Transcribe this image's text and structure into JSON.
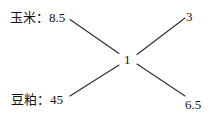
{
  "diagram": {
    "type": "node-edge-tree",
    "background_color": "#ffffff",
    "line_color": "#2b2b2b",
    "text_color": "#141414",
    "center": {
      "label": "1"
    },
    "left_nodes": [
      {
        "name": "corn",
        "label": "玉米：8.5",
        "commodity": "玉米",
        "value": "8.5"
      },
      {
        "name": "soybean-meal",
        "label": "豆粕：45",
        "commodity": "豆粕",
        "value": "45"
      }
    ],
    "right_nodes": [
      {
        "name": "top-right",
        "label": "3",
        "value": "3"
      },
      {
        "name": "bottom-right",
        "label": "6.5",
        "value": "6.5"
      }
    ],
    "edges": [
      {
        "from": "corn",
        "to": "center"
      },
      {
        "from": "soybean-meal",
        "to": "center"
      },
      {
        "from": "center",
        "to": "top-right"
      },
      {
        "from": "center",
        "to": "bottom-right"
      }
    ]
  }
}
